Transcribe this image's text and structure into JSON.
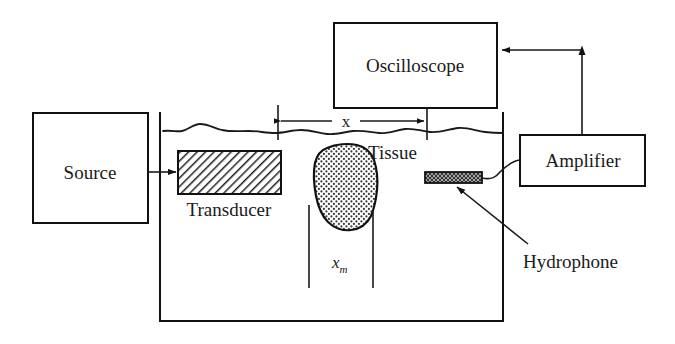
{
  "figure": {
    "type": "schematic-block-diagram",
    "colors": {
      "stroke": "#111111",
      "text": "#1a1a1a",
      "background": "#ffffff",
      "transducer_fill": "#8c8c8c",
      "tissue_fill": "#e8e8e8",
      "hydrophone_fill": "#bdbdbd"
    }
  },
  "blocks": {
    "source": {
      "label": "Source"
    },
    "oscilloscope": {
      "label": "Oscilloscope"
    },
    "amplifier": {
      "label": "Amplifier"
    }
  },
  "components": {
    "transducer": {
      "label": "Transducer",
      "hatch": "diagonal"
    },
    "tissue": {
      "label": "Tissue",
      "fill_pattern": "stipple-dots"
    },
    "hydrophone": {
      "label": "Hydrophone",
      "fill_pattern": "cross-hatch"
    },
    "water_tank": {
      "label": "",
      "surface": "wavy-water-line"
    }
  },
  "dimensions": {
    "x": {
      "label": "x",
      "description": "separation between transducer face plane and hydrophone plane"
    },
    "xm": {
      "base": "x",
      "subscript": "m",
      "description": "lateral extent of tissue sample"
    }
  },
  "connectors": [
    {
      "name": "source-to-transducer",
      "from": "source",
      "to": "transducer",
      "arrow": "single"
    },
    {
      "name": "hydrophone-to-amplifier",
      "from": "hydrophone",
      "to": "amplifier",
      "arrow": "none"
    },
    {
      "name": "amplifier-to-oscilloscope",
      "from": "amplifier",
      "to": "oscilloscope",
      "arrow": "single"
    },
    {
      "name": "hydrophone-callout",
      "from": "hydrophone-label",
      "to": "hydrophone",
      "arrow": "single"
    }
  ]
}
